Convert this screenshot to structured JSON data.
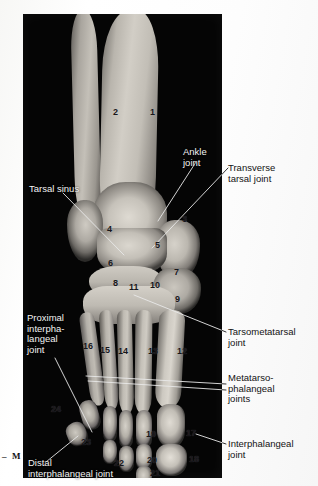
{
  "figure": {
    "background_color": "#050505",
    "page_color": "#ffffff"
  },
  "orientation_marker": {
    "label": "M",
    "dash": "–"
  },
  "labels_inside": [
    {
      "id": "ankle-joint",
      "text_lines": [
        "Ankle",
        "joint"
      ]
    },
    {
      "id": "tarsal-sinus",
      "text_lines": [
        "Tarsal sinus"
      ]
    },
    {
      "id": "proximal-ip-joint",
      "text_lines": [
        "Proximal",
        "interpha-",
        "langeal",
        "joint"
      ]
    },
    {
      "id": "distal-ip-joint",
      "text_lines": [
        "Distal",
        "interphalangeal joint"
      ]
    }
  ],
  "labels_outside": [
    {
      "id": "transverse-tarsal-joint",
      "text_lines": [
        "Transverse",
        "tarsal joint"
      ]
    },
    {
      "id": "tarsometatarsal-joint",
      "text_lines": [
        "Tarsometatarsal",
        "joint"
      ]
    },
    {
      "id": "metatarsophalangeal-joints",
      "text_lines": [
        "Metatarso-",
        "phalangeal",
        "joints"
      ]
    },
    {
      "id": "interphalangeal-joint",
      "text_lines": [
        "Interphalangeal",
        "joint"
      ]
    }
  ],
  "callout_numbers": [
    {
      "n": "1",
      "x": 150,
      "y": 108
    },
    {
      "n": "2",
      "x": 113,
      "y": 108
    },
    {
      "n": "3",
      "x": 182,
      "y": 215
    },
    {
      "n": "4",
      "x": 107,
      "y": 225
    },
    {
      "n": "5",
      "x": 155,
      "y": 241
    },
    {
      "n": "6",
      "x": 108,
      "y": 259
    },
    {
      "n": "7",
      "x": 174,
      "y": 268
    },
    {
      "n": "8",
      "x": 113,
      "y": 279
    },
    {
      "n": "9",
      "x": 175,
      "y": 295
    },
    {
      "n": "10",
      "x": 150,
      "y": 281
    },
    {
      "n": "11",
      "x": 129,
      "y": 283
    },
    {
      "n": "12",
      "x": 177,
      "y": 347
    },
    {
      "n": "13",
      "x": 148,
      "y": 347
    },
    {
      "n": "14",
      "x": 118,
      "y": 347
    },
    {
      "n": "15",
      "x": 100,
      "y": 346
    },
    {
      "n": "16",
      "x": 83,
      "y": 342
    },
    {
      "n": "17",
      "x": 186,
      "y": 429
    },
    {
      "n": "18",
      "x": 189,
      "y": 455
    },
    {
      "n": "19",
      "x": 146,
      "y": 430
    },
    {
      "n": "20",
      "x": 147,
      "y": 456
    },
    {
      "n": "21",
      "x": 150,
      "y": 469
    },
    {
      "n": "22",
      "x": 114,
      "y": 459
    },
    {
      "n": "23",
      "x": 81,
      "y": 438
    },
    {
      "n": "24",
      "x": 51,
      "y": 405
    }
  ],
  "leader_lines": [
    {
      "id": "ankle-joint-leader",
      "x1": 196,
      "y1": 162,
      "x2": 158,
      "y2": 221
    },
    {
      "id": "tarsal-sinus-leader",
      "x1": 63,
      "y1": 193,
      "x2": 124,
      "y2": 255
    },
    {
      "id": "transverse-tarsal-joint-leader",
      "x1": 228,
      "y1": 168,
      "x2": 152,
      "y2": 248
    },
    {
      "id": "tarsometatarsal-joint-leader",
      "x1": 226,
      "y1": 332,
      "x2": 134,
      "y2": 295
    },
    {
      "id": "mtp-joints-leader-upper",
      "x1": 226,
      "y1": 384,
      "x2": 86,
      "y2": 376
    },
    {
      "id": "mtp-joints-leader-lower",
      "x1": 226,
      "y1": 390,
      "x2": 88,
      "y2": 381
    },
    {
      "id": "ip-joint-leader",
      "x1": 226,
      "y1": 444,
      "x2": 196,
      "y2": 434
    },
    {
      "id": "proximal-ip-joint-leader",
      "x1": 55,
      "y1": 358,
      "x2": 92,
      "y2": 432
    },
    {
      "id": "distal-ip-joint-leader",
      "x1": 46,
      "y1": 462,
      "x2": 78,
      "y2": 436
    }
  ]
}
